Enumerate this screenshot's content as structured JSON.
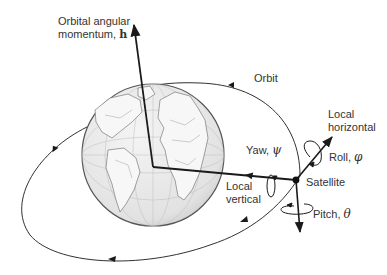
{
  "diagram": {
    "labels": {
      "h_line1": "Orbital angular",
      "h_line2": "momentum, ",
      "h_symbol": "h",
      "orbit": "Orbit",
      "local_horizontal_1": "Local",
      "local_horizontal_2": "horizontal",
      "yaw": "Yaw, ",
      "yaw_symbol": "ψ",
      "roll": "Roll, ",
      "roll_symbol": "φ",
      "satellite": "Satellite",
      "local_vertical_1": "Local",
      "local_vertical_2": "vertical",
      "pitch": "Pitch, ",
      "pitch_symbol": "θ"
    },
    "colors": {
      "ink": "#1a1a1a",
      "globe_fill": "#e6e6e6",
      "globe_edge": "#555555",
      "text": "#333333"
    }
  }
}
